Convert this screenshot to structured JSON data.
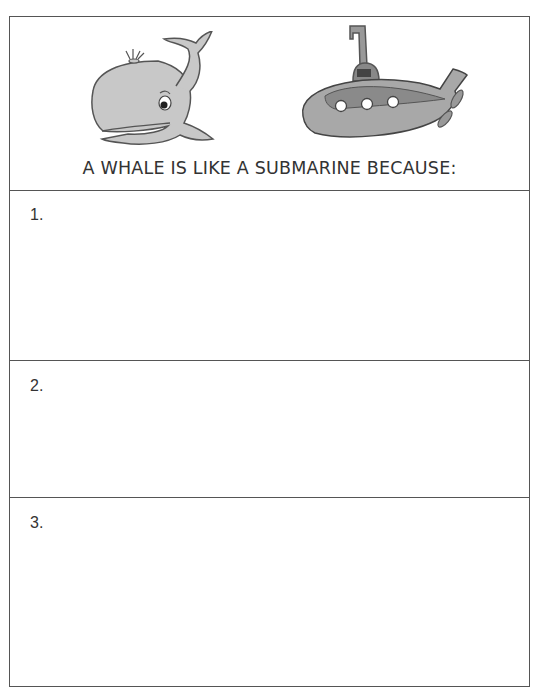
{
  "worksheet": {
    "title": "A WHALE IS LIKE A SUBMARINE BECAUSE:",
    "images": [
      {
        "name": "whale-icon",
        "label": "whale"
      },
      {
        "name": "submarine-icon",
        "label": "submarine"
      }
    ],
    "rows": [
      {
        "number": "1.",
        "answer": ""
      },
      {
        "number": "2.",
        "answer": ""
      },
      {
        "number": "3.",
        "answer": ""
      }
    ]
  }
}
